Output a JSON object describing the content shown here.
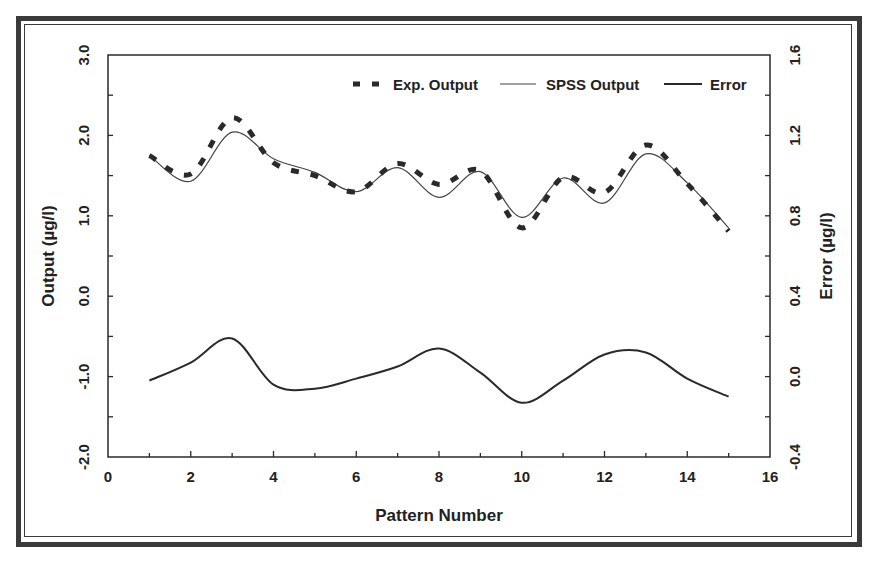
{
  "chart_data": {
    "type": "line",
    "title": "",
    "xlabel": "Pattern Number",
    "ylabel": "Output (µg/l)",
    "y2label": "Error (µg/l)",
    "xlim": [
      0,
      16
    ],
    "ylim": [
      -2.0,
      3.0
    ],
    "y2lim": [
      -0.4,
      1.6
    ],
    "xticks": [
      "0",
      "2",
      "4",
      "6",
      "8",
      "10",
      "12",
      "14",
      "16"
    ],
    "yticks": [
      "-2.0",
      "-1.0",
      "0.0",
      "1.0",
      "2.0",
      "3.0"
    ],
    "y2ticks": [
      "-0.4",
      "0.0",
      "0.4",
      "0.8",
      "1.2",
      "1.6"
    ],
    "grid": false,
    "legend_position": "top-right inside",
    "x": [
      1,
      2,
      3,
      4,
      5,
      6,
      7,
      8,
      9,
      10,
      11,
      12,
      13,
      14,
      15
    ],
    "series": [
      {
        "name": "Exp. Output",
        "axis": "left",
        "style": "dashed-thick",
        "values": [
          1.75,
          1.52,
          2.22,
          1.66,
          1.5,
          1.3,
          1.65,
          1.39,
          1.56,
          0.85,
          1.48,
          1.29,
          1.88,
          1.4,
          0.81
        ]
      },
      {
        "name": "SPSS Output",
        "axis": "left",
        "style": "solid-thin",
        "values": [
          1.75,
          1.43,
          2.04,
          1.71,
          1.54,
          1.3,
          1.6,
          1.23,
          1.55,
          0.98,
          1.47,
          1.16,
          1.77,
          1.41,
          0.85
        ]
      },
      {
        "name": "Error",
        "axis": "right",
        "style": "solid-medium",
        "values": [
          -0.02,
          0.07,
          0.19,
          -0.04,
          -0.06,
          -0.01,
          0.05,
          0.14,
          0.02,
          -0.13,
          -0.02,
          0.11,
          0.12,
          -0.01,
          -0.1
        ]
      }
    ]
  },
  "legend": {
    "exp_label": "Exp. Output",
    "spss_label": "SPSS Output",
    "error_label": "Error"
  },
  "axes": {
    "x_title": "Pattern Number",
    "y_left_title": "Output (µg/l)",
    "y_right_title": "Error (µg/l)"
  },
  "colors": {
    "line": "#2a2a2a",
    "frame": "#3a3a3a",
    "text": "#222222"
  }
}
